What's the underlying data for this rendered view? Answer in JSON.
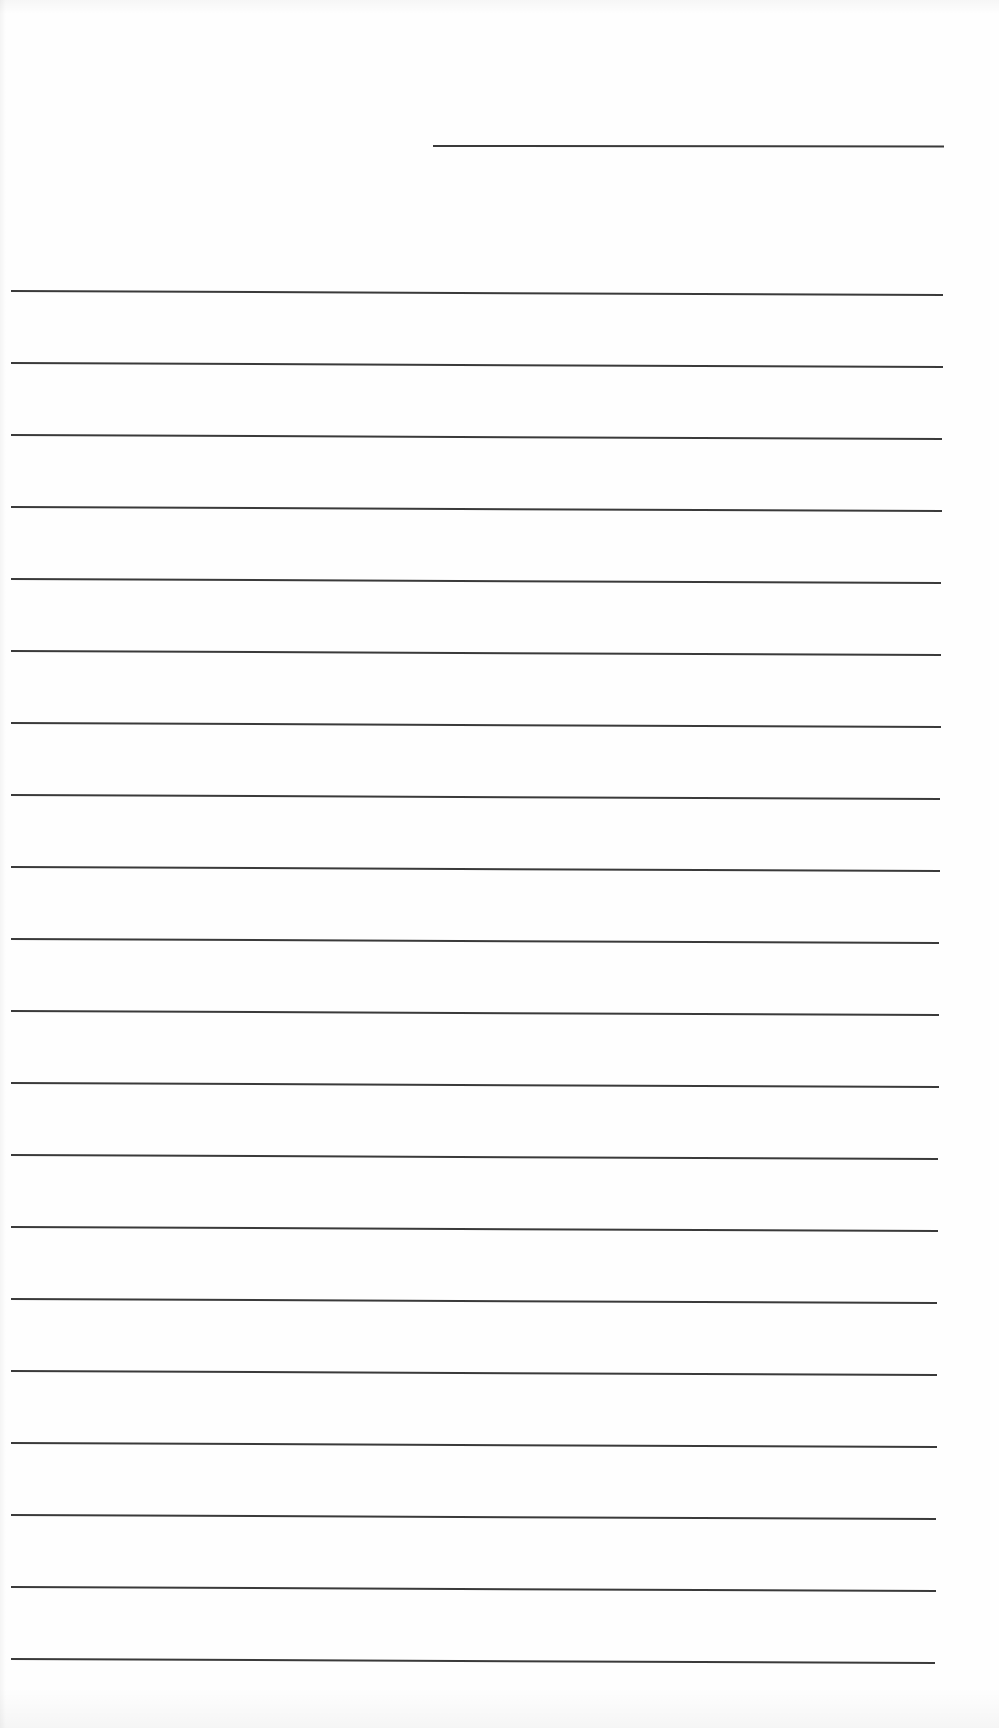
{
  "document": {
    "type": "lined-paper",
    "background_color": "#fefefe",
    "line_color": "#3a3a3a",
    "header_line": {
      "left": 433,
      "width": 511,
      "top": 145
    },
    "ruled_lines": {
      "count": 20,
      "left": 11,
      "width": 932,
      "first_top": 290,
      "spacing": 72,
      "tilt_deg": 0.25
    },
    "text_content": []
  }
}
